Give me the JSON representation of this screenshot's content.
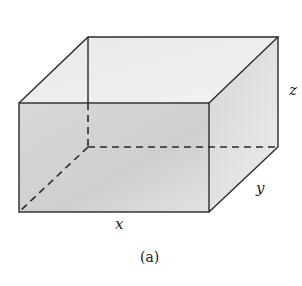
{
  "figure": {
    "type": "rectangular box diagram",
    "labels": {
      "x": "x",
      "y": "y",
      "z": "z"
    },
    "caption": "(a)",
    "colors": {
      "edge": "#2a2a2a",
      "face_front": "#d4d4d4",
      "face_top": "#e6e6e6",
      "face_side": "#dadada"
    }
  }
}
